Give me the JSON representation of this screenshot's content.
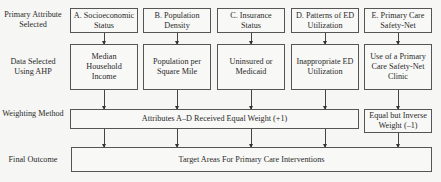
{
  "row_labels": {
    "primary": "Primary Attribute Selected",
    "data": "Data Selected Using AHP",
    "weighting": "Weighting Method",
    "outcome": "Final Outcome"
  },
  "attributes": [
    {
      "label": "A. Socioeconomic Status",
      "data": "Median Household Income"
    },
    {
      "label": "B. Population Density",
      "data": "Population per Square Mile"
    },
    {
      "label": "C. Insurance Status",
      "data": "Uninsured or Medicaid"
    },
    {
      "label": "D. Patterns of ED Utilization",
      "data": "Inappropriate ED Utilization"
    },
    {
      "label": "E. Primary Care Safety-Net",
      "data": "Use of a Primary Care Safety-Net Clinic"
    }
  ],
  "weighting": {
    "equal": "Attributes A–D Received Equal Weight (+1)",
    "inverse": "Equal but Inverse Weight (–1)"
  },
  "outcome": "Target Areas For Primary Care Interventions"
}
